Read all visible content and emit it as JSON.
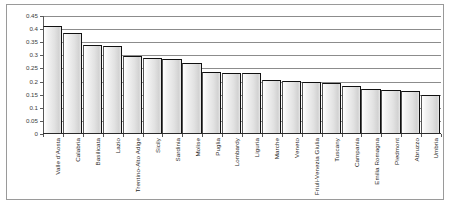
{
  "chart_data": {
    "type": "bar",
    "title": "",
    "subtitle": "",
    "xlabel": "",
    "ylabel": "",
    "ylim": [
      0,
      0.45
    ],
    "grid": true,
    "legend": false,
    "y_ticks": [
      0,
      0.05,
      0.1,
      0.15,
      0.2,
      0.25,
      0.3,
      0.35,
      0.4,
      0.45
    ],
    "y_tick_labels": [
      "0",
      "0.05",
      "0.1",
      "0.15",
      "0.2",
      "0.25",
      "0.3",
      "0.35",
      "0.4",
      "0.45"
    ],
    "categories": [
      "Valle d'Aosta",
      "Calabria",
      "Basilicata",
      "Lazio",
      "Trentino-Alto Adige",
      "Sicily",
      "Sardinia",
      "Molise",
      "Puglia",
      "Lombardy",
      "Liguria",
      "Marche",
      "Veneto",
      "Friuli-Venezia Giulia",
      "Tuscany",
      "Campania",
      "Emilia Romagna",
      "Piedmont",
      "Abruzzo",
      "Umbria"
    ],
    "values": [
      0.411,
      0.384,
      0.34,
      0.335,
      0.296,
      0.291,
      0.286,
      0.272,
      0.235,
      0.233,
      0.232,
      0.206,
      0.203,
      0.198,
      0.193,
      0.185,
      0.17,
      0.169,
      0.163,
      0.147
    ],
    "bar_color": "#e2e2e2",
    "bar_edge_color": "#111111",
    "gridline_color": "#8c8c8c",
    "axis_color": "#2a2a2a",
    "background_color": "#ffffff"
  }
}
